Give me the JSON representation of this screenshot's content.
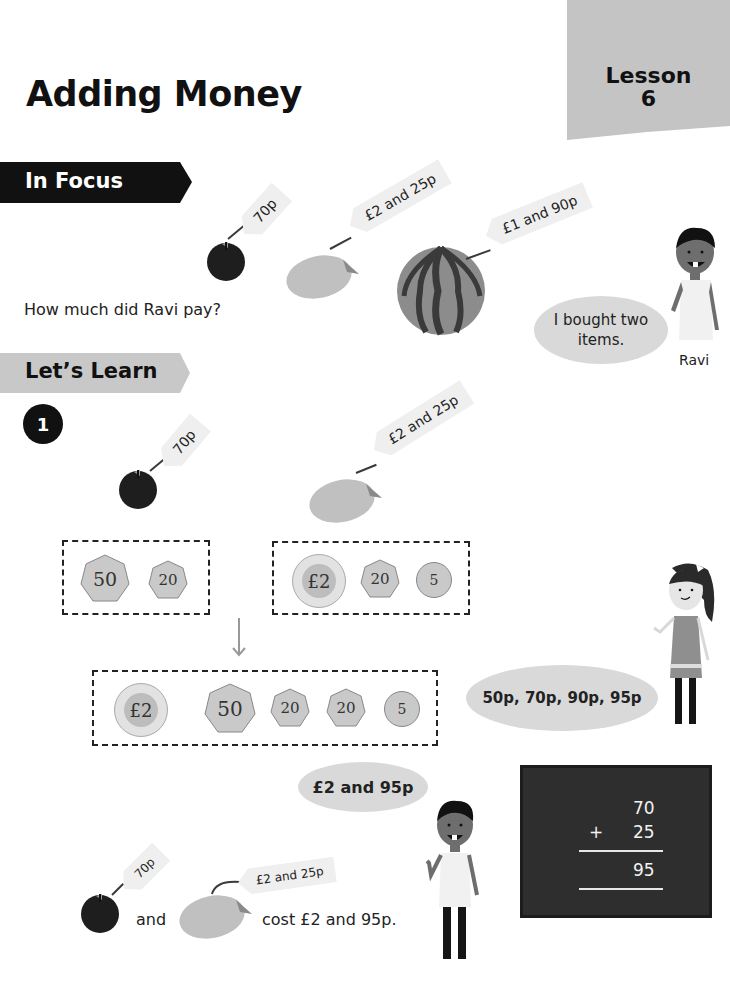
{
  "header": {
    "title": "Adding Money",
    "lesson_label": "Lesson",
    "lesson_number": "6"
  },
  "in_focus": {
    "banner_label": "In Focus",
    "items": [
      {
        "name": "apple",
        "price_tag": "70p"
      },
      {
        "name": "mango",
        "price_tag": "£2 and 25p"
      },
      {
        "name": "watermelon",
        "price_tag": "£1 and 90p"
      }
    ],
    "question": "How much did Ravi pay?",
    "character": {
      "name": "Ravi",
      "speech": "I bought two items."
    }
  },
  "lets_learn": {
    "banner_label": "Let’s Learn",
    "step_number": "1",
    "items": [
      {
        "name": "apple",
        "price_tag": "70p"
      },
      {
        "name": "mango",
        "price_tag": "£2 and 25p"
      }
    ],
    "coin_groups": [
      {
        "coins": [
          "50",
          "20"
        ]
      },
      {
        "coins": [
          "£2",
          "20",
          "5"
        ]
      }
    ],
    "combined_coins": [
      "£2",
      "50",
      "20",
      "20",
      "5"
    ],
    "girl_speech": "50p, 70p, 90p, 95p",
    "boy_speech": "£2 and 95p",
    "blackboard": {
      "addend1": "70",
      "operator": "+",
      "addend2": "25",
      "sum": "95"
    },
    "summary": {
      "apple_tag": "70p",
      "mango_tag": "£2 and 25p",
      "and_word": "and",
      "result_text": "cost £2 and 95p."
    }
  },
  "colors": {
    "banner_dark": "#111111",
    "banner_light": "#c8c8c8",
    "lesson_tab": "#c4c4c4",
    "bubble": "#d9d9d9",
    "blackboard": "#2e2e2e",
    "coin": "#c9c9c9"
  }
}
